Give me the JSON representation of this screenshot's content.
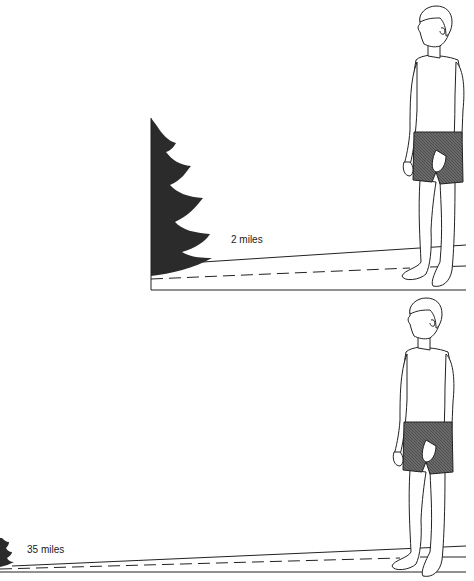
{
  "panels": [
    {
      "id": "near",
      "distance_label": "2 miles",
      "tree_color": "#2a2a2a",
      "shorts_color": "#555555"
    },
    {
      "id": "far",
      "distance_label": "35 miles",
      "tree_color": "#2a2a2a",
      "shorts_color": "#555555"
    }
  ]
}
